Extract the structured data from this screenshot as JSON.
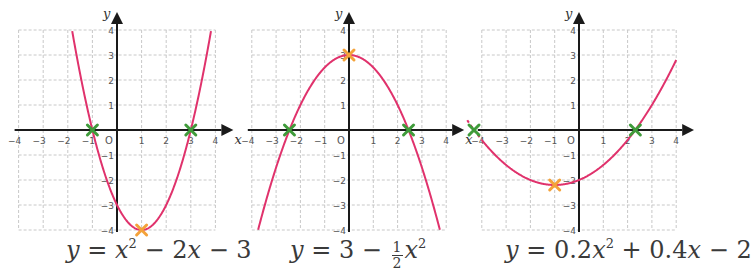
{
  "colors": {
    "curve": "#e0326c",
    "root_marker": "#3f9b3a",
    "vertex_marker": "#f4a23a",
    "grid": "#c8c8c8",
    "axis": "#1a1a1a",
    "tick_label": "#555555"
  },
  "chart_data": [
    {
      "type": "line",
      "title": "y = x² − 2x − 3",
      "equation": {
        "a": 1,
        "b": -2,
        "c": -3
      },
      "xlabel": "x",
      "ylabel": "y",
      "xlim": [
        -4,
        4
      ],
      "ylim": [
        -4,
        4
      ],
      "x_ticks": [
        -4,
        -3,
        -2,
        -1,
        0,
        1,
        2,
        3,
        4
      ],
      "y_ticks": [
        -4,
        -3,
        -2,
        -1,
        0,
        1,
        2,
        3,
        4
      ],
      "origin_label": "O",
      "grid": true,
      "roots": [
        [
          -1,
          0
        ],
        [
          3,
          0
        ]
      ],
      "vertex": [
        1,
        -4
      ],
      "y_intercept": [
        0,
        -3
      ],
      "layout": {
        "x0": 117,
        "y0": 130,
        "ux": 24.6,
        "uy": 25
      }
    },
    {
      "type": "line",
      "title": "y = 3 − ½x²",
      "equation": {
        "a": -0.5,
        "b": 0,
        "c": 3
      },
      "xlabel": "x",
      "ylabel": "y",
      "xlim": [
        -4,
        4
      ],
      "ylim": [
        -4,
        4
      ],
      "x_ticks": [
        -4,
        -3,
        -2,
        -1,
        0,
        1,
        2,
        3,
        4
      ],
      "y_ticks": [
        -4,
        -3,
        -2,
        -1,
        0,
        1,
        2,
        3,
        4
      ],
      "origin_label": "O",
      "grid": true,
      "roots": [
        [
          -2.45,
          0
        ],
        [
          2.45,
          0
        ]
      ],
      "vertex": [
        0,
        3
      ],
      "layout": {
        "x0": 349,
        "y0": 130,
        "ux": 24.3,
        "uy": 25
      }
    },
    {
      "type": "line",
      "title": "y = 0.2x² + 0.4x − 2",
      "equation": {
        "a": 0.2,
        "b": 0.4,
        "c": -2
      },
      "xlabel": "x",
      "ylabel": "y",
      "xlim": [
        -4,
        4
      ],
      "ylim": [
        -4,
        4
      ],
      "x_ticks": [
        -4,
        -3,
        -2,
        -1,
        0,
        1,
        2,
        3,
        4
      ],
      "y_ticks": [
        -4,
        -3,
        -2,
        -1,
        0,
        1,
        2,
        3,
        4
      ],
      "origin_label": "O",
      "grid": true,
      "roots": [
        [
          -4.32,
          0
        ],
        [
          2.32,
          0
        ]
      ],
      "vertex": [
        -1,
        -2.2
      ],
      "dashed_extension_to_x": -4.6,
      "layout": {
        "x0": 579,
        "y0": 130,
        "ux": 24.3,
        "uy": 25
      }
    }
  ],
  "equations": [
    {
      "lhs": "y",
      "eq": "=",
      "parts": [
        "x",
        "2",
        "− 2",
        "x",
        "− 3"
      ]
    },
    {
      "lhs": "y",
      "eq": "=",
      "parts": [
        "3 −",
        "1",
        "2",
        "x",
        "2"
      ]
    },
    {
      "lhs": "y",
      "eq": "=",
      "parts": [
        "0.2",
        "x",
        "2",
        "+ 0.4",
        "x",
        "− 2"
      ]
    }
  ]
}
